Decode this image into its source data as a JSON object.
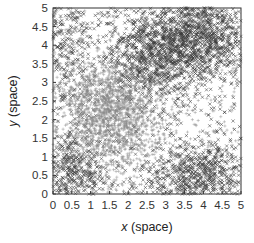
{
  "chart_data": {
    "type": "scatter",
    "title": "",
    "xlabel": "x (space)",
    "ylabel": "y (space)",
    "xlabel_var": "x",
    "xlabel_unit": "(space)",
    "ylabel_var": "y",
    "ylabel_unit": "(space)",
    "xlim": [
      0,
      5
    ],
    "ylim": [
      0,
      5
    ],
    "xticks": [
      "0",
      "0.5",
      "1",
      "1.5",
      "2",
      "2.5",
      "3",
      "3.5",
      "4",
      "4.5",
      "5"
    ],
    "yticks": [
      "0",
      "0.5",
      "1",
      "1.5",
      "2",
      "2.5",
      "3",
      "3.5",
      "4",
      "4.5",
      "5"
    ],
    "grid": false,
    "legend": null,
    "series": [
      {
        "name": "species-x",
        "marker": "x",
        "color": "#3a3a3a",
        "description": "Dark x markers, dense in upper-right band (x 2.5-5, y 3-5), lower-right (x 3-5, y 0-1.5), and lower-left corner (x 0-1, y 0-1)",
        "clusters": [
          {
            "cx": 3.6,
            "cy": 4.2,
            "sx": 0.9,
            "sy": 0.6,
            "n": 1500
          },
          {
            "cx": 2.6,
            "cy": 3.4,
            "sx": 0.5,
            "sy": 0.5,
            "n": 400
          },
          {
            "cx": 3.9,
            "cy": 0.5,
            "sx": 0.8,
            "sy": 0.45,
            "n": 700
          },
          {
            "cx": 0.5,
            "cy": 0.6,
            "sx": 0.5,
            "sy": 0.5,
            "n": 450
          },
          {
            "cx": 0.3,
            "cy": 4.0,
            "sx": 0.4,
            "sy": 0.8,
            "n": 250
          },
          {
            "cx": 2.5,
            "cy": 2.5,
            "sx": 2.5,
            "sy": 2.5,
            "n": 600,
            "uniform": true
          }
        ]
      },
      {
        "name": "species-plus",
        "marker": "+",
        "color": "#8a8a8a",
        "description": "Lighter + markers, dense around center-left (x~1.6, y~2), sparse elsewhere",
        "clusters": [
          {
            "cx": 1.6,
            "cy": 2.0,
            "sx": 0.65,
            "sy": 0.7,
            "n": 1300
          },
          {
            "cx": 1.2,
            "cy": 2.8,
            "sx": 0.6,
            "sy": 0.5,
            "n": 300
          },
          {
            "cx": 2.5,
            "cy": 2.5,
            "sx": 2.5,
            "sy": 2.5,
            "n": 500,
            "uniform": true
          }
        ]
      }
    ]
  },
  "axes": {
    "x_label_var": "x",
    "x_label_unit": " (space)",
    "y_label_var": "y",
    "y_label_unit": " (space)"
  }
}
